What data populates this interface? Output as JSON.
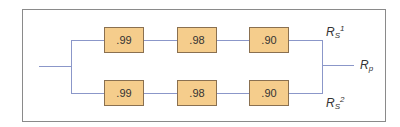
{
  "diagram": {
    "type": "parallel-series reliability block diagram",
    "paths": [
      {
        "components": [
          ".99",
          ".98",
          ".90"
        ],
        "output_label": {
          "base": "R",
          "sub": "S",
          "sup": "1"
        }
      },
      {
        "components": [
          ".99",
          ".98",
          ".90"
        ],
        "output_label": {
          "base": "R",
          "sub": "S",
          "sup": "2"
        }
      }
    ],
    "system_output": {
      "base": "R",
      "sub": "p"
    },
    "colors": {
      "box_fill": "#f5cd8c",
      "line": "#8b97c9",
      "frame": "#8a8a8a"
    }
  }
}
